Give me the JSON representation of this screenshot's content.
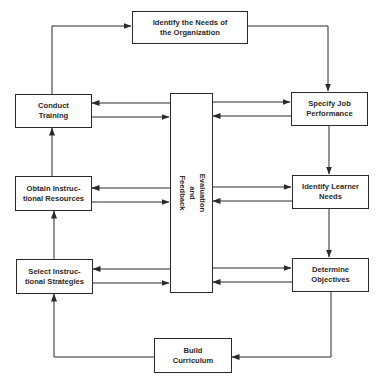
{
  "diagram": {
    "type": "flowchart",
    "colors": {
      "stroke": "#2a2a2a",
      "background": "#ffffff",
      "text": "#2a2a2a"
    },
    "nodes": {
      "identify_org": {
        "label": "Identify the Needs of\nthe Organization"
      },
      "conduct_training": {
        "label": "Conduct\nTraining"
      },
      "specify_job": {
        "label": "Specify Job\nPerformance"
      },
      "obtain_resources": {
        "label": "Obtain Instruc-\ntional Resources"
      },
      "identify_learner": {
        "label": "Identify Learner\nNeeds"
      },
      "select_strategies": {
        "label": "Select Instruc-\ntional Strategies"
      },
      "determine_objectives": {
        "label": "Determine\nObjectives"
      },
      "build_curriculum": {
        "label": "Build\nCurriculum"
      },
      "evaluation_feedback": {
        "label": "Evaluation\nand\nFeedback"
      }
    },
    "edges": [
      {
        "from": "identify_org",
        "to": "specify_job"
      },
      {
        "from": "specify_job",
        "to": "identify_learner"
      },
      {
        "from": "identify_learner",
        "to": "determine_objectives"
      },
      {
        "from": "determine_objectives",
        "to": "build_curriculum"
      },
      {
        "from": "build_curriculum",
        "to": "select_strategies"
      },
      {
        "from": "select_strategies",
        "to": "obtain_resources"
      },
      {
        "from": "obtain_resources",
        "to": "conduct_training"
      },
      {
        "from": "conduct_training",
        "to": "identify_org"
      },
      {
        "from": "evaluation_feedback",
        "to": "conduct_training",
        "bidirectional": true
      },
      {
        "from": "evaluation_feedback",
        "to": "obtain_resources",
        "bidirectional": true
      },
      {
        "from": "evaluation_feedback",
        "to": "select_strategies",
        "bidirectional": true
      },
      {
        "from": "evaluation_feedback",
        "to": "specify_job",
        "bidirectional": true
      },
      {
        "from": "evaluation_feedback",
        "to": "identify_learner",
        "bidirectional": true
      },
      {
        "from": "evaluation_feedback",
        "to": "determine_objectives",
        "bidirectional": true
      }
    ]
  }
}
